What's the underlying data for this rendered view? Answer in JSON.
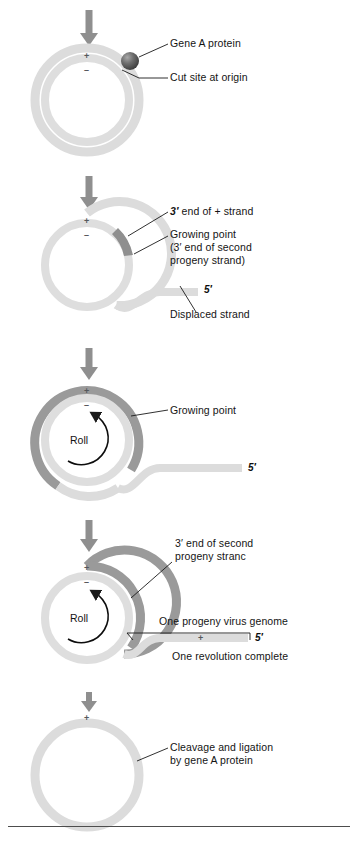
{
  "figure": {
    "colors": {
      "light_strand": "#dcdcdc",
      "light_strand_alt": "#e2e2e2",
      "dark_strand": "#9a9a9a",
      "wedge_dark": "#8c8c8c",
      "protein_ball": "#555555",
      "arrow": "#8f8f8f",
      "leader": "#1a1a1a",
      "text": "#141414",
      "rule": "#4d4d4d"
    }
  },
  "stages": [
    {
      "id": "stage-1",
      "name": "initiation",
      "plus_tick": "+",
      "minus_tick": "–",
      "labels": [
        {
          "id": "gene-a-protein",
          "text": "Gene A protein"
        },
        {
          "id": "cut-site-at-origin",
          "text": "Cut site at origin"
        }
      ]
    },
    {
      "id": "stage-2",
      "name": "displacement-begins",
      "plus_tick": "+",
      "minus_tick": "–",
      "labels": [
        {
          "id": "three-prime-end-plus-strand",
          "text": "3′ end of + strand",
          "prefix_bold": "3′"
        },
        {
          "id": "growing-point",
          "text": "Growing point\n(3′ end of second\nprogeny strand)"
        },
        {
          "id": "displaced-strand",
          "text": "Displaced strand"
        }
      ],
      "five_prime": "5′"
    },
    {
      "id": "stage-3",
      "name": "rolling",
      "plus_tick": "+",
      "minus_tick": "–",
      "roll_label": "Roll",
      "labels": [
        {
          "id": "growing-point",
          "text": "Growing point"
        }
      ],
      "five_prime": "5′"
    },
    {
      "id": "stage-4",
      "name": "one-revolution-complete",
      "plus_tick": "+",
      "minus_tick": "–",
      "roll_label": "Roll",
      "strand_plus_tick": "+",
      "labels": [
        {
          "id": "three-prime-end-second-progeny-strand",
          "text": "3′ end of second\nprogeny stranc"
        },
        {
          "id": "one-progeny-virus-genome",
          "text": "One progeny virus genome"
        },
        {
          "id": "one-revolution-complete",
          "text": "One revolution complete"
        }
      ],
      "five_prime": "5′"
    },
    {
      "id": "stage-5",
      "name": "cleavage-and-ligation",
      "plus_tick": "+",
      "labels": [
        {
          "id": "cleavage-and-ligation",
          "text": "Cleavage and ligation\nby gene A protein"
        }
      ]
    }
  ],
  "arrows": [
    {
      "id": "arrow-1"
    },
    {
      "id": "arrow-2"
    },
    {
      "id": "arrow-3"
    },
    {
      "id": "arrow-4"
    },
    {
      "id": "arrow-5"
    }
  ]
}
